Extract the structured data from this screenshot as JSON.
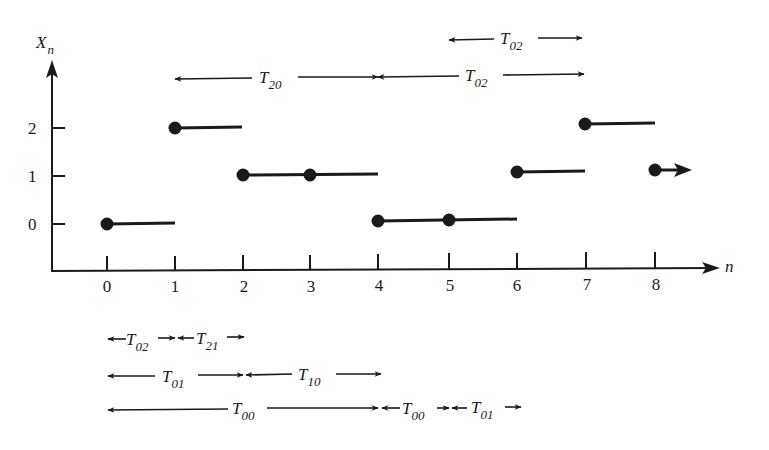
{
  "diagram": {
    "y_axis_label": "X",
    "y_axis_label_sub": "n",
    "x_axis_label": "n",
    "x_ticks": [
      "0",
      "1",
      "2",
      "3",
      "4",
      "5",
      "6",
      "7",
      "8"
    ],
    "y_ticks": [
      "0",
      "1",
      "2"
    ],
    "sample_path": [
      {
        "n": 0,
        "state": 0
      },
      {
        "n": 1,
        "state": 2
      },
      {
        "n": 2,
        "state": 1
      },
      {
        "n": 3,
        "state": 1
      },
      {
        "n": 4,
        "state": 0
      },
      {
        "n": 5,
        "state": 0
      },
      {
        "n": 6,
        "state": 1
      },
      {
        "n": 7,
        "state": 2
      },
      {
        "n": 8,
        "state": 1
      }
    ],
    "top_intervals": [
      {
        "label": "T",
        "sub": "02",
        "from": 5,
        "to": 7,
        "row": 1
      },
      {
        "label": "T",
        "sub": "20",
        "from": 1,
        "to": 4,
        "row": 2
      },
      {
        "label": "T",
        "sub": "02",
        "from": 4,
        "to": 7,
        "row": 2
      }
    ],
    "bottom_intervals": [
      {
        "label": "T",
        "sub": "02",
        "from": 0,
        "to": 1,
        "row": 1
      },
      {
        "label": "T",
        "sub": "21",
        "from": 1,
        "to": 2,
        "row": 1
      },
      {
        "label": "T",
        "sub": "01",
        "from": 0,
        "to": 2,
        "row": 2
      },
      {
        "label": "T",
        "sub": "10",
        "from": 2,
        "to": 4,
        "row": 2
      },
      {
        "label": "T",
        "sub": "00",
        "from": 0,
        "to": 4,
        "row": 3
      },
      {
        "label": "T",
        "sub": "00",
        "from": 4,
        "to": 5,
        "row": 3
      },
      {
        "label": "T",
        "sub": "01",
        "from": 5,
        "to": 6,
        "row": 3
      }
    ]
  }
}
